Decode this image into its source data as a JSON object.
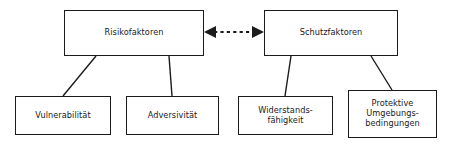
{
  "diagram": {
    "type": "hierarchy-flow-diagram",
    "background_color": "#ffffff",
    "stroke_color": "#1b1b1b",
    "text_color": "#1a1a1a",
    "nodes": {
      "risikofaktoren": {
        "label": "Risikofaktoren"
      },
      "schutzfaktoren": {
        "label": "Schutzfaktoren"
      },
      "vulnerabilitaet": {
        "label": "Vulnerabilität"
      },
      "adversivitaet": {
        "label": "Adversivität"
      },
      "widerstandsfaehigkeit": {
        "label": "Widerstands-\nfähigkeit"
      },
      "protektive_umgebungsbedingungen": {
        "label": "Protektive\nUmgebungs-\nbedingungen"
      }
    },
    "connectors": {
      "risiko_schutz": {
        "style": "dashed",
        "arrowheads": "both",
        "from": "risikofaktoren",
        "to": "schutzfaktoren"
      },
      "tree_links": [
        {
          "from": "risikofaktoren",
          "to": "vulnerabilitaet",
          "style": "solid"
        },
        {
          "from": "risikofaktoren",
          "to": "adversivitaet",
          "style": "solid"
        },
        {
          "from": "schutzfaktoren",
          "to": "widerstandsfaehigkeit",
          "style": "solid"
        },
        {
          "from": "schutzfaktoren",
          "to": "protektive_umgebungsbedingungen",
          "style": "solid"
        }
      ]
    }
  }
}
